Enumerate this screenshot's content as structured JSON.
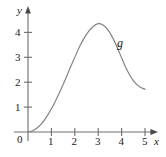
{
  "chart_data": {
    "type": "line",
    "title": "",
    "subtitle": "",
    "xlabel": "x",
    "ylabel": "y",
    "xlim": [
      0,
      5.4
    ],
    "ylim": [
      0,
      4.8
    ],
    "grid": false,
    "legend_position": "inline-annotation",
    "origin_label": "0",
    "x_ticks": [
      1,
      2,
      3,
      4,
      5
    ],
    "x_tick_labels": [
      "1",
      "2",
      "3",
      "4",
      "5"
    ],
    "y_ticks": [
      1,
      2,
      3,
      4
    ],
    "y_tick_labels": [
      "1",
      "2",
      "3",
      "4"
    ],
    "series": [
      {
        "name": "g",
        "annotation": "g",
        "color": "#808080",
        "x": [
          0.0,
          0.2,
          0.4,
          0.6,
          0.8,
          1.0,
          1.2,
          1.4,
          1.6,
          1.8,
          2.0,
          2.2,
          2.4,
          2.6,
          2.8,
          3.0,
          3.2,
          3.4,
          3.6,
          3.8,
          4.0,
          4.2,
          4.4,
          4.6,
          4.8,
          5.0
        ],
        "values": [
          0.0,
          0.05,
          0.17,
          0.36,
          0.62,
          0.93,
          1.3,
          1.7,
          2.12,
          2.57,
          3.0,
          3.42,
          3.77,
          4.05,
          4.25,
          4.35,
          4.3,
          4.12,
          3.82,
          3.42,
          2.98,
          2.55,
          2.2,
          1.95,
          1.8,
          1.72
        ]
      }
    ],
    "annotations": [
      {
        "text": "g",
        "x": 3.85,
        "y": 3.5
      }
    ],
    "axis_color": "#6e6e6e",
    "text_color": "#1a1a1a"
  },
  "figure": {
    "y_axis_label": "y",
    "x_axis_label": "x",
    "origin": "0",
    "curve_label": "g",
    "x_labels": [
      "1",
      "2",
      "3",
      "4",
      "5"
    ],
    "y_labels": [
      "1",
      "2",
      "3",
      "4"
    ]
  }
}
